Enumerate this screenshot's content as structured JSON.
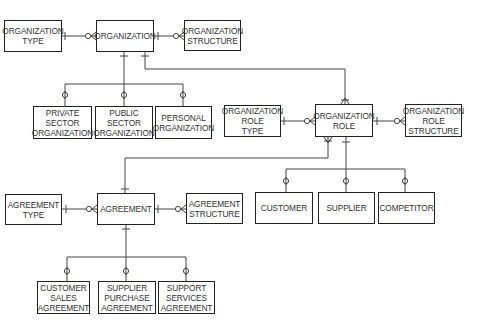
{
  "diagram": {
    "type": "entity-relationship",
    "entities": {
      "organization_type": {
        "lines": [
          "ORGANIZATION",
          "TYPE"
        ]
      },
      "organization": {
        "lines": [
          "ORGANIZATION"
        ]
      },
      "organization_structure": {
        "lines": [
          "ORGANIZATION",
          "STRUCTURE"
        ]
      },
      "private_sector_organization": {
        "lines": [
          "PRIVATE",
          "SECTOR",
          "ORGANIZATION"
        ]
      },
      "public_sector_organization": {
        "lines": [
          "PUBLIC",
          "SECTOR",
          "ORGANIZATION"
        ]
      },
      "personal_organization": {
        "lines": [
          "PERSONAL",
          "ORGANIZATION"
        ]
      },
      "organization_role_type": {
        "lines": [
          "ORGANIZATION",
          "ROLE",
          "TYPE"
        ]
      },
      "organization_role": {
        "lines": [
          "ORGANIZATION",
          "ROLE"
        ]
      },
      "organization_role_structure": {
        "lines": [
          "ORGANIZATION",
          "ROLE",
          "STRUCTURE"
        ]
      },
      "customer": {
        "lines": [
          "CUSTOMER"
        ]
      },
      "supplier": {
        "lines": [
          "SUPPLIER"
        ]
      },
      "competitor": {
        "lines": [
          "COMPETITOR"
        ]
      },
      "agreement_type": {
        "lines": [
          "AGREEMENT",
          "TYPE"
        ]
      },
      "agreement": {
        "lines": [
          "AGREEMENT"
        ]
      },
      "agreement_structure": {
        "lines": [
          "AGREEMENT",
          "STRUCTURE"
        ]
      },
      "customer_sales_agreement": {
        "lines": [
          "CUSTOMER",
          "SALES",
          "AGREEMENT"
        ]
      },
      "supplier_purchase_agreement": {
        "lines": [
          "SUPPLIER",
          "PURCHASE",
          "AGREEMENT"
        ]
      },
      "support_services_agreement": {
        "lines": [
          "SUPPORT",
          "SERVICES",
          "AGREEMENT"
        ]
      }
    },
    "relationships": [
      {
        "from": "ORGANIZATION TYPE",
        "to": "ORGANIZATION",
        "cardinality": "one-to-zero-or-many"
      },
      {
        "from": "ORGANIZATION",
        "to": "ORGANIZATION STRUCTURE",
        "cardinality": "one-to-zero-or-many"
      },
      {
        "from": "ORGANIZATION",
        "to": "ORGANIZATION ROLE",
        "cardinality": "one-to-many"
      },
      {
        "from": "ORGANIZATION ROLE TYPE",
        "to": "ORGANIZATION ROLE",
        "cardinality": "one-to-zero-or-many"
      },
      {
        "from": "ORGANIZATION ROLE",
        "to": "ORGANIZATION ROLE STRUCTURE",
        "cardinality": "one-to-zero-or-many"
      },
      {
        "from": "AGREEMENT",
        "to": "ORGANIZATION ROLE",
        "cardinality": "one-to-many"
      },
      {
        "from": "AGREEMENT TYPE",
        "to": "AGREEMENT",
        "cardinality": "one-to-zero-or-many"
      },
      {
        "from": "AGREEMENT",
        "to": "AGREEMENT STRUCTURE",
        "cardinality": "one-to-zero-or-many"
      }
    ],
    "subtypes": [
      {
        "parent": "ORGANIZATION",
        "children": [
          "PRIVATE SECTOR ORGANIZATION",
          "PUBLIC SECTOR ORGANIZATION",
          "PERSONAL ORGANIZATION"
        ]
      },
      {
        "parent": "ORGANIZATION ROLE",
        "children": [
          "CUSTOMER",
          "SUPPLIER",
          "COMPETITOR"
        ]
      },
      {
        "parent": "AGREEMENT",
        "children": [
          "CUSTOMER SALES AGREEMENT",
          "SUPPLIER PURCHASE AGREEMENT",
          "SUPPORT SERVICES AGREEMENT"
        ]
      }
    ],
    "colors": {
      "line": "#444444",
      "border": "#222222",
      "text": "#333333",
      "background": "#ffffff"
    }
  }
}
